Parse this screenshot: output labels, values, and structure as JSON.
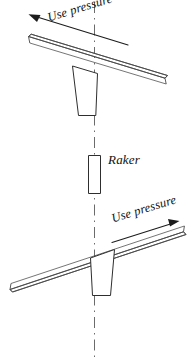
{
  "figure": {
    "background_color": "#ffffff",
    "line_color": "#4a4a4a",
    "text_color": "#111111",
    "centerline_color": "#6b6b6b",
    "width": 188,
    "height": 361
  },
  "annotations": {
    "use_pressure_top": "Use pressure",
    "use_pressure_bottom": "Use pressure",
    "raker": "Raker"
  },
  "panels": {
    "top": {
      "name": "top-view",
      "description": "File bar tilted down to the right over raker tooth",
      "pressure_direction": "up-left"
    },
    "bottom": {
      "name": "bottom-view",
      "description": "File bar tilted up to the right over raker tooth",
      "pressure_direction": "up-right"
    },
    "middle": {
      "name": "raker-detail",
      "description": "Upright raker tooth profile"
    }
  }
}
